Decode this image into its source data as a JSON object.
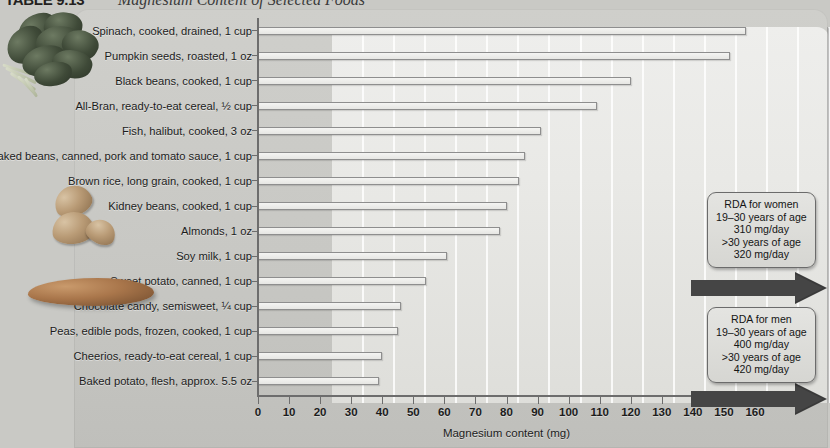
{
  "figure": {
    "table_label": "TABLE 9.13",
    "title": "Magnesium Content of Selected Foods"
  },
  "chart_data": {
    "type": "bar",
    "orientation": "horizontal",
    "title": "Magnesium Content of Selected Foods",
    "xlabel": "Magnesium content (mg)",
    "ylabel": "",
    "xlim": [
      0,
      160
    ],
    "xticks": [
      0,
      10,
      20,
      30,
      40,
      50,
      60,
      70,
      80,
      90,
      100,
      110,
      120,
      130,
      140,
      150,
      160
    ],
    "grid": "vertical",
    "legend": "none",
    "categories": [
      "Spinach, cooked, drained, 1 cup",
      "Pumpkin seeds, roasted, 1 oz",
      "Black beans, cooked, 1 cup",
      "All-Bran, ready-to-eat cereal, ½ cup",
      "Fish, halibut, cooked, 3 oz",
      "Baked beans, canned, pork and tomato sauce, 1 cup",
      "Brown rice, long grain, cooked, 1 cup",
      "Kidney beans, cooked, 1 cup",
      "Almonds, 1 oz",
      "Soy milk, 1 cup",
      "Sweet potato, canned, 1 cup",
      "Chocolate candy, semisweet, ¼ cup",
      "Peas, edible pods, frozen, cooked, 1 cup",
      "Cheerios, ready-to-eat cereal, 1 cup",
      "Baked potato, flesh, approx. 5.5 oz"
    ],
    "values": [
      157,
      152,
      120,
      109,
      91,
      86,
      84,
      80,
      78,
      61,
      54,
      46,
      45,
      40,
      39
    ],
    "units": "mg"
  },
  "annotations": {
    "women": {
      "title": "RDA for women",
      "line2": "19–30 years of age",
      "line3": "310 mg/day",
      "line4": ">30 years of age",
      "line5": "320 mg/day"
    },
    "men": {
      "title": "RDA for men",
      "line2": "19–30 years of age",
      "line3": "400 mg/day",
      "line4": ">30 years of age",
      "line5": "420 mg/day"
    }
  },
  "photos": [
    {
      "name": "spinach-photo",
      "alt": "spinach leaves"
    },
    {
      "name": "almonds-photo",
      "alt": "almonds"
    },
    {
      "name": "sweet-potato-photo",
      "alt": "sweet potato"
    }
  ],
  "colors": {
    "panel_bg": "#c8c8c4",
    "plot_bg": "#eaeae7",
    "axis": "#6d6d6d",
    "bar_fill": "#eeeeec",
    "bar_stroke": "#8e8e8e",
    "arrow": "#3a3a3a",
    "text": "#1c1c1c"
  }
}
